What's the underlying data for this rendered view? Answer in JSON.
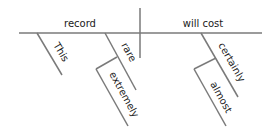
{
  "diagram": {
    "type": "sentence-diagram",
    "subject": "record",
    "predicate": "will cost",
    "modifiers": {
      "subject": [
        {
          "word": "This"
        },
        {
          "word": "rare",
          "modifier": "extremely"
        }
      ],
      "predicate": [
        {
          "word": "certainly",
          "modifier": "almost"
        }
      ]
    },
    "labels": {
      "subject": "record",
      "predicate": "will cost",
      "this": "This",
      "rare": "rare",
      "extremely": "extremely",
      "certainly": "certainly",
      "almost": "almost"
    },
    "colors": {
      "line": "#7a7a7a",
      "text": "#1a1a1a",
      "background": "#ffffff"
    }
  }
}
